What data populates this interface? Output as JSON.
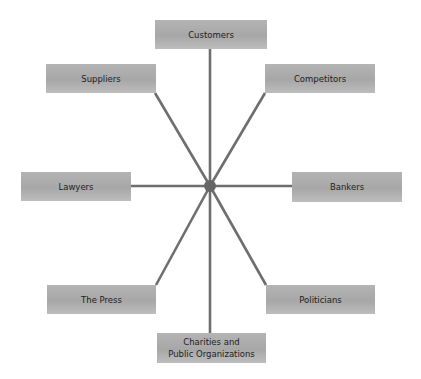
{
  "diagram": {
    "type": "hub-and-spoke stakeholder diagram",
    "hub": {
      "x": 210,
      "y": 186,
      "radius": 6,
      "color": "#666666"
    },
    "line_color": "#6e6e6e",
    "box_color": "#aaaaaa",
    "nodes": [
      {
        "id": "customers",
        "label": "Customers",
        "x": 155,
        "y": 20,
        "w": 112,
        "h": 29,
        "ax": 210,
        "ay": 49
      },
      {
        "id": "suppliers",
        "label": "Suppliers",
        "x": 46,
        "y": 64,
        "w": 110,
        "h": 29,
        "ax": 155,
        "ay": 93
      },
      {
        "id": "competitors",
        "label": "Competitors",
        "x": 265,
        "y": 64,
        "w": 110,
        "h": 29,
        "ax": 265,
        "ay": 93
      },
      {
        "id": "lawyers",
        "label": "Lawyers",
        "x": 21,
        "y": 172,
        "w": 110,
        "h": 29,
        "ax": 131,
        "ay": 186
      },
      {
        "id": "bankers",
        "label": "Bankers",
        "x": 292,
        "y": 172,
        "w": 110,
        "h": 30,
        "ax": 292,
        "ay": 186
      },
      {
        "id": "the-press",
        "label": "The Press",
        "x": 47,
        "y": 285,
        "w": 109,
        "h": 29,
        "ax": 156,
        "ay": 285
      },
      {
        "id": "politicians",
        "label": "Politicians",
        "x": 266,
        "y": 285,
        "w": 109,
        "h": 29,
        "ax": 266,
        "ay": 285
      },
      {
        "id": "charities",
        "label": "Charities and\nPublic Organizations",
        "x": 157,
        "y": 333,
        "w": 109,
        "h": 30,
        "ax": 210,
        "ay": 333
      }
    ]
  }
}
